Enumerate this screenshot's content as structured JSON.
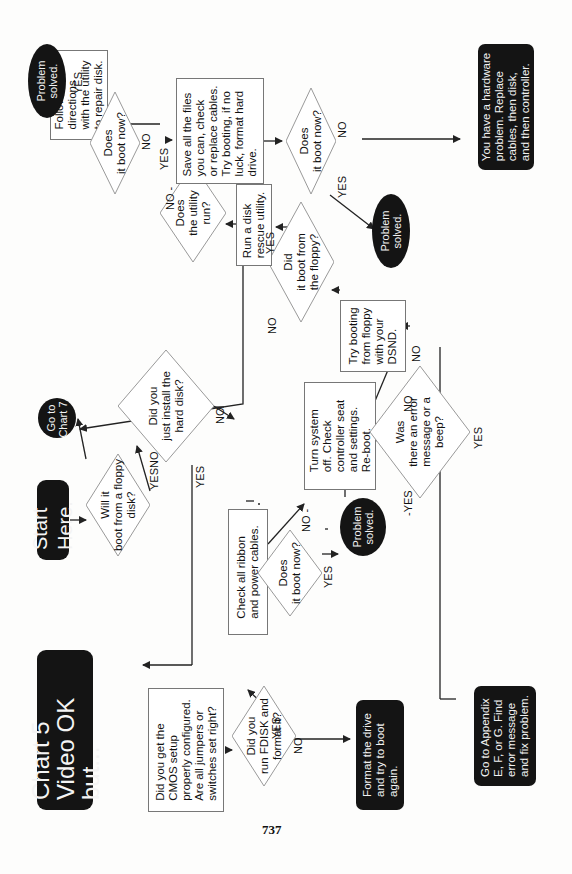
{
  "title": "Chart 5\nVideo OK but...",
  "page_number": "737",
  "nodes": {
    "start": "Start Here.",
    "will_boot_floppy": "Will it\nboot from a floppy\ndisk?",
    "go_chart7": "Go to\nChart 7.",
    "just_install": "Did you\njust install the\nhard disk?",
    "cmos": "Did you get the\nCMOS setup\nproperly configured.\nAre all jumpers or\nswitches set right?",
    "fdisk": "Did you\nrun FDISK and\nformat it?",
    "format_drive": "Format the drive\nand try to boot\nagain.",
    "check_cables": "Check all ribbon\nand power cables.",
    "boot_now_1": "Does\nit boot now?",
    "solved_1": "Problem\nsolved.",
    "turn_off": "Turn system\noff. Check\ncontroller seat\nand settings.\nRe-boot.",
    "boot_now_2": "Does\nit boot now?",
    "error_beep": "Was\nthere an error\nmessage or a\nbeep?",
    "appendix": "Go to Appendix\nE, F, or G. Find\nerror message\nand fix problem.",
    "try_floppy": "Try booting\nfrom floppy\nwith your\nDSND.",
    "boot_floppy": "Did\nit boot from\nthe floppy?",
    "rescue": "Run a disk\nrescue utility.",
    "utility_run": "Does\nthe utility\nrun?",
    "follow": "Follow the\ndirections\nwith the utility\nto repair disk.",
    "boot_now_3": "Does\nit boot now?",
    "solved_2": "Problem\nsolved.",
    "save_files": "Save all the files\nyou can, check\nor replace cables.\nTry booting, if no\nluck, format hard\ndrive.",
    "boot_now_4": "Does\nit boot now?",
    "solved_3": "Problem\nsolved.",
    "hardware": "You have a hardware\nproblem. Replace\ncables, then disk,\nand then controller."
  },
  "labels": {
    "yes": "YES",
    "no": "NO",
    "no_dash": "NO -",
    "dash_yes": "-YES",
    "dash_no": "-NO-"
  },
  "colors": {
    "terminal_fill": "#141414",
    "terminal_text": "#f2f2f2",
    "box_border": "#777777",
    "line": "#222222"
  }
}
